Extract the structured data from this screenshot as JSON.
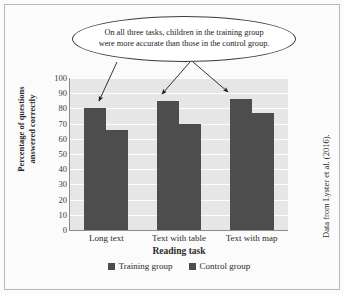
{
  "chart_data": {
    "type": "bar",
    "title": "",
    "xlabel": "Reading task",
    "ylabel": "Percentage of questions answered correctly",
    "ylabel_line1": "Percentage of questions",
    "ylabel_line2": "answered correctly",
    "categories": [
      "Long text",
      "Text with table",
      "Text with map"
    ],
    "series": [
      {
        "name": "Training group",
        "values": [
          80,
          85,
          86
        ],
        "color": "#4d4d4d"
      },
      {
        "name": "Control group",
        "values": [
          66,
          70,
          77
        ],
        "color": "#4d4d4d"
      }
    ],
    "ylim": [
      0,
      100
    ],
    "yticks": [
      100,
      90,
      80,
      70,
      60,
      50,
      40,
      30,
      20,
      10,
      0
    ],
    "grid": true,
    "legend_position": "bottom",
    "plot_background": "#e6e6e6",
    "gridline_color": "#fdfdfd",
    "annotations": [
      {
        "text": "On all three tasks, children in the training group were more accurate than those in the control group.",
        "line1": "On all three tasks, children in the training group",
        "line2": "were more accurate than those in the control group.",
        "shape": "ellipse",
        "points_to": [
          "Long text training bar",
          "Text with table training bar",
          "Text with map training bar"
        ]
      }
    ]
  },
  "side_caption": "Data from Lyster et al. (2016)."
}
